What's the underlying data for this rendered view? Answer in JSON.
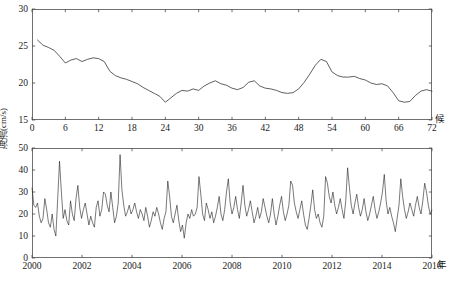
{
  "figure": {
    "y_axis_title": "海流(cm/s)",
    "caption": ""
  },
  "chart_data": [
    {
      "type": "line",
      "panel": "top",
      "title": "",
      "xlabel": "候",
      "ylabel": "海流(cm/s)",
      "xlim": [
        0,
        72
      ],
      "ylim": [
        15,
        30
      ],
      "xticks": [
        0,
        6,
        12,
        18,
        24,
        30,
        36,
        42,
        48,
        54,
        60,
        66,
        72
      ],
      "yticks": [
        15,
        20,
        25,
        30
      ],
      "xtick_labels": [
        "0",
        "6",
        "12",
        "18",
        "24",
        "30",
        "36",
        "42",
        "48",
        "54",
        "60",
        "66",
        "72"
      ],
      "ytick_labels": [
        "15",
        "20",
        "25",
        "30"
      ],
      "grid": false,
      "legend": "none",
      "line_color": "#2b2b2b",
      "x": [
        1,
        2,
        3,
        4,
        5,
        6,
        7,
        8,
        9,
        10,
        11,
        12,
        13,
        14,
        15,
        16,
        17,
        18,
        19,
        20,
        21,
        22,
        23,
        24,
        25,
        26,
        27,
        28,
        29,
        30,
        31,
        32,
        33,
        34,
        35,
        36,
        37,
        38,
        39,
        40,
        41,
        42,
        43,
        44,
        45,
        46,
        47,
        48,
        49,
        50,
        51,
        52,
        53,
        54,
        55,
        56,
        57,
        58,
        59,
        60,
        61,
        62,
        63,
        64,
        65,
        66,
        67,
        68,
        69,
        70,
        71,
        72
      ],
      "values": [
        25.8,
        25.1,
        24.8,
        24.4,
        23.6,
        22.7,
        23.1,
        23.3,
        22.9,
        23.2,
        23.4,
        23.3,
        22.9,
        21.6,
        21.0,
        20.7,
        20.5,
        20.2,
        19.9,
        19.4,
        19.0,
        18.6,
        18.2,
        17.4,
        18.0,
        18.6,
        19.0,
        18.9,
        19.2,
        19.0,
        19.6,
        20.0,
        20.3,
        19.9,
        19.7,
        19.3,
        19.1,
        19.4,
        20.1,
        20.3,
        19.6,
        19.3,
        19.2,
        19.0,
        18.7,
        18.6,
        18.7,
        19.2,
        20.1,
        21.2,
        22.4,
        23.2,
        22.9,
        21.5,
        21.0,
        20.8,
        20.8,
        20.9,
        20.6,
        20.4,
        20.0,
        19.8,
        19.9,
        19.6,
        18.7,
        17.6,
        17.4,
        17.5,
        18.3,
        18.9,
        19.1,
        18.9
      ]
    },
    {
      "type": "line",
      "panel": "bottom",
      "title": "",
      "xlabel": "年",
      "ylabel": "海流(cm/s)",
      "xlim": [
        2000,
        2016
      ],
      "ylim": [
        0,
        50
      ],
      "xticks": [
        2000,
        2002,
        2004,
        2006,
        2008,
        2010,
        2012,
        2014,
        2016
      ],
      "yticks": [
        0,
        10,
        20,
        30,
        40,
        50
      ],
      "xtick_labels": [
        "2000",
        "2002",
        "2004",
        "2006",
        "2008",
        "2010",
        "2012",
        "2014",
        "2016"
      ],
      "ytick_labels": [
        "0",
        "10",
        "20",
        "30",
        "40",
        "50"
      ],
      "grid": false,
      "legend": "none",
      "line_color": "#1f1f1f",
      "note": "Monthly mean current speed, 2000-2016 (192 points)",
      "values": [
        32,
        24,
        23,
        25,
        19,
        16,
        18,
        27,
        22,
        16,
        14,
        20,
        13,
        10,
        27,
        44,
        30,
        18,
        22,
        17,
        15,
        26,
        20,
        17,
        27,
        33,
        23,
        18,
        22,
        25,
        20,
        15,
        19,
        16,
        14,
        23,
        26,
        19,
        22,
        30,
        29,
        24,
        21,
        30,
        23,
        16,
        19,
        25,
        47,
        31,
        24,
        19,
        21,
        24,
        20,
        22,
        25,
        21,
        18,
        22,
        20,
        17,
        23,
        19,
        14,
        17,
        21,
        19,
        23,
        20,
        16,
        13,
        18,
        21,
        35,
        28,
        19,
        16,
        20,
        24,
        17,
        12,
        15,
        9,
        16,
        20,
        18,
        22,
        19,
        20,
        23,
        37,
        29,
        20,
        17,
        25,
        22,
        18,
        21,
        16,
        19,
        23,
        28,
        20,
        17,
        22,
        30,
        36,
        25,
        20,
        23,
        28,
        22,
        18,
        25,
        33,
        24,
        19,
        22,
        26,
        21,
        16,
        19,
        23,
        18,
        21,
        27,
        23,
        19,
        16,
        20,
        27,
        20,
        15,
        19,
        24,
        28,
        21,
        17,
        20,
        24,
        35,
        33,
        25,
        21,
        18,
        22,
        26,
        20,
        15,
        13,
        18,
        24,
        31,
        22,
        18,
        20,
        16,
        14,
        19,
        37,
        34,
        28,
        25,
        30,
        24,
        20,
        23,
        27,
        22,
        18,
        26,
        41,
        32,
        24,
        20,
        25,
        29,
        23,
        19,
        22,
        27,
        21,
        17,
        20,
        24,
        28,
        22,
        18,
        21,
        25,
        30,
        38,
        26,
        20,
        23,
        19,
        16,
        12,
        18,
        24,
        36,
        28,
        22,
        18,
        21,
        25,
        22,
        19,
        24,
        28,
        23,
        20,
        26,
        34,
        30,
        24,
        20,
        22
      ]
    }
  ]
}
